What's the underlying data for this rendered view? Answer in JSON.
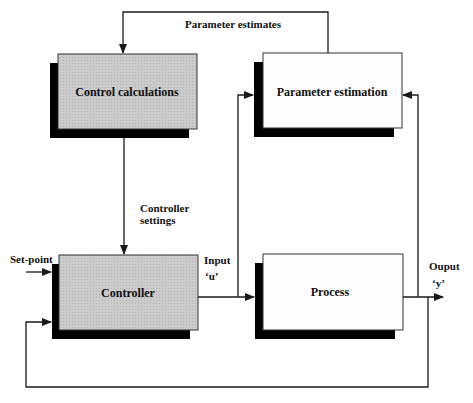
{
  "diagram": {
    "type": "block-diagram",
    "colors": {
      "shaded_box": "#c8c8c8",
      "white_box": "#ffffff",
      "shadow": "#000000",
      "line": "#1a1a1a"
    },
    "blocks": [
      {
        "id": "control-calculations",
        "label": "Control calculations",
        "fill": "shaded"
      },
      {
        "id": "parameter-estimation",
        "label": "Parameter estimation",
        "fill": "white"
      },
      {
        "id": "controller",
        "label": "Controller",
        "fill": "shaded"
      },
      {
        "id": "process",
        "label": "Process",
        "fill": "white"
      }
    ],
    "labels": {
      "parameter_estimates": "Parameter estimates",
      "controller_settings_line1": "Controller",
      "controller_settings_line2": "settings",
      "set_point": "Set-point",
      "input_line1": "Input",
      "input_line2": "‘u’",
      "output_line1": "Ouput",
      "output_line2": "‘y’"
    },
    "edges": [
      {
        "from": "parameter-estimation",
        "to": "control-calculations",
        "label": "Parameter estimates"
      },
      {
        "from": "control-calculations",
        "to": "controller",
        "label": "Controller settings"
      },
      {
        "from": "set-point",
        "to": "controller",
        "label": "Set-point"
      },
      {
        "from": "controller",
        "to": "process",
        "label": "Input 'u'"
      },
      {
        "from": "controller-output",
        "to": "parameter-estimation",
        "label": "Input 'u'"
      },
      {
        "from": "process",
        "to": "output",
        "label": "Ouput 'y'"
      },
      {
        "from": "process-output",
        "to": "parameter-estimation",
        "label": ""
      },
      {
        "from": "process-output",
        "to": "controller",
        "label": "feedback"
      }
    ]
  }
}
